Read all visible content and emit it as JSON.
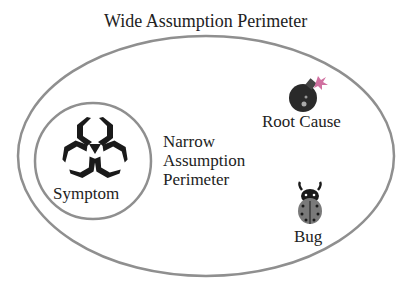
{
  "title": "Wide Assumption Perimeter",
  "inner_label": "Narrow Assumption Perimeter",
  "inner_label_lines": [
    "Narrow",
    "Assumption",
    "Perimeter"
  ],
  "nodes": {
    "symptom": {
      "label": "Symptom",
      "icon": "biohazard-icon"
    },
    "root_cause": {
      "label": "Root Cause",
      "icon": "bomb-icon"
    },
    "bug": {
      "label": "Bug",
      "icon": "ladybug-icon"
    }
  },
  "colors": {
    "outline": "#8f8f8f",
    "text": "#222222",
    "icon_dark": "#1a1a1a",
    "bug_body": "#7a7a7a",
    "spark": "#d070a0"
  }
}
